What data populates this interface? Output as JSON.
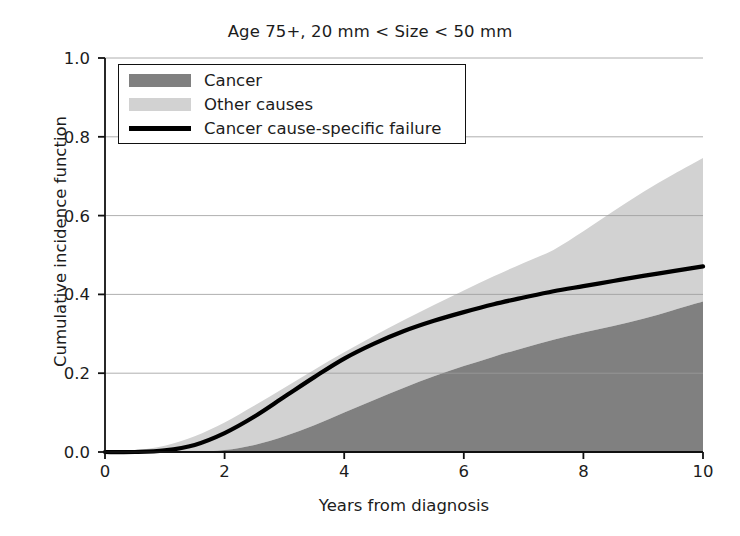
{
  "chart_data": {
    "type": "area",
    "title": "Age 75+, 20 mm < Size < 50 mm",
    "xlabel": "Years from diagnosis",
    "ylabel": "Cumulative incidence function",
    "xlim": [
      0,
      10
    ],
    "ylim": [
      0.0,
      1.0
    ],
    "xticks": [
      "0",
      "2",
      "4",
      "6",
      "8",
      "10"
    ],
    "xtick_values": [
      0,
      2,
      4,
      6,
      8,
      10
    ],
    "yticks": [
      "0.0",
      "0.2",
      "0.4",
      "0.6",
      "0.8",
      "1.0"
    ],
    "ytick_values": [
      0.0,
      0.2,
      0.4,
      0.6,
      0.8,
      1.0
    ],
    "grid": "horizontal",
    "legend_position": "upper-left-inside",
    "stacked": true,
    "x": [
      0,
      0.5,
      1,
      1.5,
      2,
      2.5,
      3,
      3.5,
      4,
      4.5,
      5,
      5.5,
      6,
      6.5,
      7,
      7.5,
      8,
      8.5,
      9,
      9.5,
      10
    ],
    "series": [
      {
        "name": "Cancer",
        "kind": "stacked-area",
        "color": "#808080",
        "values": [
          0.0,
          0.0,
          0.0,
          0.0,
          0.005,
          0.018,
          0.04,
          0.068,
          0.1,
          0.132,
          0.163,
          0.192,
          0.218,
          0.242,
          0.264,
          0.285,
          0.303,
          0.32,
          0.338,
          0.36,
          0.382
        ]
      },
      {
        "name": "Other causes",
        "kind": "stacked-area",
        "color": "#d2d2d2",
        "values": [
          0.0,
          0.004,
          0.016,
          0.04,
          0.075,
          0.118,
          0.163,
          0.209,
          0.253,
          0.295,
          0.335,
          0.373,
          0.41,
          0.446,
          0.48,
          0.513,
          0.56,
          0.611,
          0.66,
          0.704,
          0.746
        ]
      },
      {
        "name": "Cancer cause-specific failure",
        "kind": "line",
        "color": "#000000",
        "values": [
          0.0,
          0.0,
          0.004,
          0.018,
          0.048,
          0.09,
          0.14,
          0.19,
          0.237,
          0.275,
          0.307,
          0.333,
          0.355,
          0.375,
          0.392,
          0.408,
          0.421,
          0.434,
          0.447,
          0.459,
          0.471
        ]
      }
    ],
    "legend_entries": [
      {
        "label": "Cancer",
        "marker": "swatch",
        "color": "#808080"
      },
      {
        "label": "Other causes",
        "marker": "swatch",
        "color": "#d2d2d2"
      },
      {
        "label": "Cancer cause-specific failure",
        "marker": "line",
        "color": "#000000"
      }
    ]
  },
  "axes_geometry": {
    "left_px": 105,
    "right_px": 703,
    "top_px": 58,
    "bottom_px": 452
  }
}
